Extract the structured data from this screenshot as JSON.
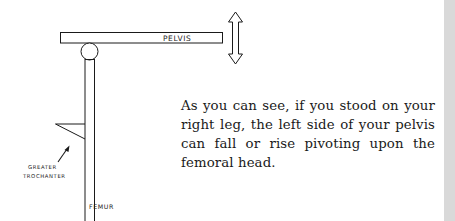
{
  "figure": {
    "labels": {
      "pelvis": "PELVIS",
      "greater": "GREATER",
      "trochanter": "TROCHANTER",
      "femur": "FEMUR"
    },
    "icons": {
      "vertical_arrow": "double-headed-vertical-arrow"
    }
  },
  "text": {
    "paragraph": "As you can see, if you stood on your right leg, the left side of your pelvis can fall or rise pivoting upon the femoral head."
  },
  "colors": {
    "ink": "#1a1a1a",
    "background": "#ffffff",
    "gutter": "#d9d9d9"
  }
}
